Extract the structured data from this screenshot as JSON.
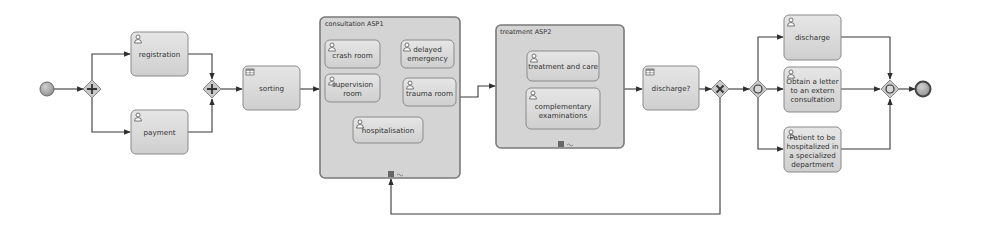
{
  "diagram": {
    "type": "BPMN process",
    "colors": {
      "task_fill": "#dcdcdc",
      "task_stroke": "#8a8a8a",
      "subprocess_fill": "#d4d4d4",
      "flow": "#3a3a3a",
      "gateway_fill": "#c8c8c8",
      "event_fill": "#a8a8a8"
    },
    "events": {
      "start": {
        "label": "start-event"
      },
      "end": {
        "label": "end-event"
      }
    },
    "gateways": [
      {
        "id": "g1",
        "kind": "parallel-split",
        "symbol": "+"
      },
      {
        "id": "g2",
        "kind": "parallel-join",
        "symbol": "+"
      },
      {
        "id": "g3",
        "kind": "exclusive",
        "symbol": "×"
      },
      {
        "id": "g4",
        "kind": "inclusive-split",
        "symbol": "○"
      },
      {
        "id": "g5",
        "kind": "inclusive-join",
        "symbol": "○"
      }
    ],
    "tasks": {
      "registration": "registration",
      "payment": "payment",
      "sorting": "sorting",
      "discharge_q": "discharge?",
      "discharge": "discharge",
      "letter": [
        "Obtain a letter",
        "to an extern",
        "consultation"
      ],
      "hospitalized": [
        "Patient to be",
        "hospitalized in",
        "a specialized",
        "department"
      ]
    },
    "subprocesses": {
      "consultation": {
        "title": "consultation ASP1",
        "tasks": {
          "crash": "crash room",
          "delayed": [
            "delayed",
            "emergency"
          ],
          "supervision": "supervision room",
          "trauma": "trauma room",
          "hospitalisation": "hospitalisation"
        },
        "marker": "≡ ~"
      },
      "treatment": {
        "title": "treatment ASP2",
        "tasks": {
          "care": "treatment and care",
          "exams": [
            "complementary",
            "examinations"
          ]
        },
        "marker": "≡ ~"
      }
    }
  }
}
